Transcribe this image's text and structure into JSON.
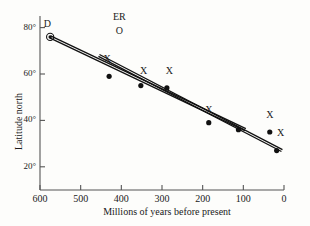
{
  "chart_data": {
    "type": "scatter",
    "title": "",
    "xlabel": "Millions of years before present",
    "ylabel": "Latitude north",
    "xlim": [
      600,
      0
    ],
    "ylim": [
      10,
      85
    ],
    "xticks": [
      600,
      500,
      400,
      300,
      200,
      100,
      0
    ],
    "xtick_labels": [
      "600",
      "500",
      "400",
      "300",
      "200",
      "100",
      "0"
    ],
    "yticks": [
      80,
      60,
      40,
      20
    ],
    "ytick_labels": [
      "80°",
      "60°",
      "40°",
      "20°"
    ],
    "grid": false,
    "legend": "none",
    "axis_style": "left-and-bottom-spines",
    "series": [
      {
        "name": "data-points",
        "marker": "filled-circle",
        "color": "#111111",
        "points": [
          {
            "x": 575,
            "y": 76,
            "marker": "circled-dot",
            "label": "D"
          },
          {
            "x": 430,
            "y": 59,
            "marker": "filled-circle",
            "label": "X"
          },
          {
            "x": 352,
            "y": 55,
            "marker": "filled-circle",
            "label": "X"
          },
          {
            "x": 288,
            "y": 54,
            "marker": "filled-circle",
            "label": "X"
          },
          {
            "x": 185,
            "y": 39,
            "marker": "filled-circle",
            "label": "X"
          },
          {
            "x": 112,
            "y": 36,
            "marker": "filled-circle",
            "label": ""
          },
          {
            "x": 35,
            "y": 35,
            "marker": "filled-circle",
            "label": "X"
          },
          {
            "x": 18,
            "y": 27,
            "marker": "filled-circle",
            "label": "X"
          }
        ]
      },
      {
        "name": "trend-line-upper",
        "style": "double-rule",
        "color": "#111111",
        "from": {
          "x": 575,
          "y": 76
        },
        "to": {
          "x": 95,
          "y": 36
        }
      },
      {
        "name": "trend-line-lower",
        "style": "double-rule",
        "color": "#111111",
        "from": {
          "x": 455,
          "y": 68
        },
        "to": {
          "x": 5,
          "y": 27
        }
      }
    ],
    "annotations": [
      {
        "text": "D",
        "x": 582,
        "y": 81,
        "name": "annotation-d"
      },
      {
        "text": "ER",
        "x": 405,
        "y": 84,
        "name": "annotation-er"
      },
      {
        "text": "O",
        "x": 405,
        "y": 78,
        "name": "annotation-o"
      },
      {
        "text": "X",
        "x": 435,
        "y": 66,
        "name": "x-marker-1"
      },
      {
        "text": "X",
        "x": 345,
        "y": 61,
        "name": "x-marker-2"
      },
      {
        "text": "X",
        "x": 282,
        "y": 61,
        "name": "x-marker-3"
      },
      {
        "text": "X",
        "x": 185,
        "y": 44,
        "name": "x-marker-4"
      },
      {
        "text": "X",
        "x": 35,
        "y": 42,
        "name": "x-marker-5"
      },
      {
        "text": "X",
        "x": 8,
        "y": 34,
        "name": "x-marker-6"
      }
    ]
  }
}
